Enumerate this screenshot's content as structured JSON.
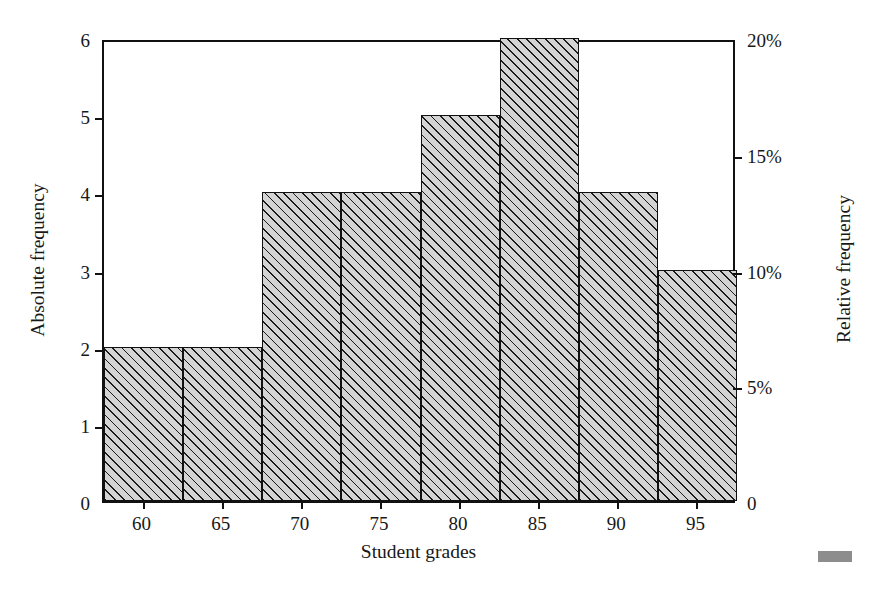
{
  "chart_data": {
    "type": "bar",
    "title": "",
    "subtitle": "",
    "xlabel": "Student grades",
    "ylabel": "Absolute frequency",
    "y2label": "Relative frequency",
    "categories": [
      "60",
      "65",
      "70",
      "75",
      "80",
      "85",
      "90",
      "95"
    ],
    "values": [
      2,
      2,
      4,
      4,
      5,
      6,
      4,
      3
    ],
    "relative_values_percent": [
      6.7,
      6.7,
      13.3,
      13.3,
      16.7,
      20.0,
      13.3,
      10.0
    ],
    "bin_centers": [
      60,
      65,
      70,
      75,
      80,
      85,
      90,
      95
    ],
    "bin_width": 5,
    "total_count": 30,
    "ylim": [
      0,
      6
    ],
    "y2lim": [
      0,
      20
    ],
    "yticks": [
      0,
      1,
      2,
      3,
      4,
      5,
      6
    ],
    "ytick_labels": [
      "0",
      "1",
      "2",
      "3",
      "4",
      "5",
      "6"
    ],
    "y2ticks": [
      0,
      5,
      10,
      15,
      20
    ],
    "y2tick_labels": [
      "0",
      "5%",
      "10%",
      "15%",
      "20%"
    ],
    "xtick_labels": [
      "60",
      "65",
      "70",
      "75",
      "80",
      "85",
      "90",
      "95"
    ],
    "grid": false,
    "legend": false,
    "legend_position": "none",
    "bar_fill_color": "#d4d4d4",
    "bar_hatch": "diagonal-forward-slash",
    "bar_edge_color": "#111111",
    "frame_color": "#111111",
    "background_color": "#ffffff"
  },
  "figure": {
    "x_axis_title": "Student grades",
    "y_axis_title_left": "Absolute frequency",
    "y_axis_title_right": "Relative frequency"
  }
}
